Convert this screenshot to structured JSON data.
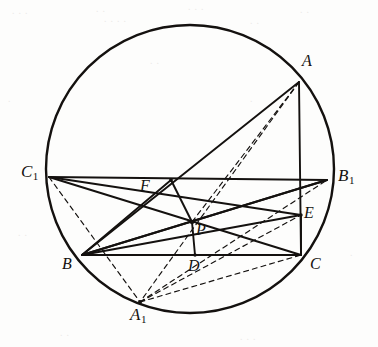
{
  "figure": {
    "kind": "geometry-diagram",
    "canvas": {
      "width": 378,
      "height": 347
    },
    "colors": {
      "ink": "#14110f",
      "paper": "#fdfdfc",
      "artifact": "#cfcdc9"
    },
    "circle": {
      "cx": 190,
      "cy": 169,
      "r": 144,
      "stroke_width": 2.4
    },
    "points": [
      {
        "id": "A",
        "label": "A",
        "sub": "",
        "x": 299,
        "y": 82,
        "label_x": 302,
        "label_y": 53
      },
      {
        "id": "B",
        "label": "B",
        "sub": "",
        "x": 82,
        "y": 255,
        "label_x": 62,
        "label_y": 256
      },
      {
        "id": "C",
        "label": "C",
        "sub": "",
        "x": 301,
        "y": 255,
        "label_x": 310,
        "label_y": 256
      },
      {
        "id": "A1",
        "label": "A",
        "sub": "1",
        "x": 140,
        "y": 302,
        "label_x": 130,
        "label_y": 306
      },
      {
        "id": "B1",
        "label": "B",
        "sub": "1",
        "x": 327,
        "y": 180,
        "label_x": 338,
        "label_y": 167
      },
      {
        "id": "C1",
        "label": "C",
        "sub": "1",
        "x": 49,
        "y": 177,
        "label_x": 21,
        "label_y": 163
      },
      {
        "id": "D",
        "label": "D",
        "sub": "",
        "x": 195,
        "y": 255,
        "label_x": 188,
        "label_y": 258
      },
      {
        "id": "E",
        "label": "E",
        "sub": "",
        "x": 301,
        "y": 215,
        "label_x": 304,
        "label_y": 205
      },
      {
        "id": "F",
        "label": "F",
        "sub": "",
        "x": 171,
        "y": 180,
        "label_x": 140,
        "label_y": 178
      },
      {
        "id": "P",
        "label": "P",
        "sub": "",
        "x": 192,
        "y": 222,
        "label_x": 196,
        "label_y": 222
      }
    ],
    "solid_segments": [
      {
        "name": "side-AB",
        "from": "A",
        "to": "B"
      },
      {
        "name": "side-AC",
        "from": "A",
        "to": "C"
      },
      {
        "name": "side-BC",
        "from": "B",
        "to": "C"
      },
      {
        "name": "chord-C1B1",
        "from": "C1",
        "to": "B1"
      },
      {
        "name": "cevian-C1-P-C",
        "from": "C1",
        "to": "C"
      },
      {
        "name": "cevian-B1-P-B",
        "from": "B1",
        "to": "B"
      },
      {
        "name": "segment-C1-E",
        "from": "C1",
        "to": "E"
      },
      {
        "name": "segment-B-E",
        "from": "B",
        "to": "E"
      },
      {
        "name": "segment-B1-B",
        "from": "B1",
        "to": "B"
      },
      {
        "name": "segment-F-P",
        "from": "F",
        "to": "P"
      },
      {
        "name": "segment-F-B",
        "from": "F",
        "to": "B"
      },
      {
        "name": "segment-P-D",
        "from": "P",
        "to": "D"
      },
      {
        "name": "segment-E-C",
        "from": "E",
        "to": "C"
      }
    ],
    "dashed_segments": [
      {
        "name": "dashed-A-A1",
        "from": "A",
        "to": "A1"
      },
      {
        "name": "dashed-A-P",
        "from": "A",
        "to": "P"
      },
      {
        "name": "dashed-C1-A1",
        "from": "C1",
        "to": "A1"
      },
      {
        "name": "dashed-A1-B1",
        "from": "A1",
        "to": "B1"
      },
      {
        "name": "dashed-A1-E",
        "from": "A1",
        "to": "E"
      },
      {
        "name": "dashed-A1-C",
        "from": "A1",
        "to": "C"
      },
      {
        "name": "dashed-B-D",
        "from": "B",
        "to": "D"
      }
    ],
    "artifacts": [
      {
        "text": "∙ ∙ ∙",
        "x": 12,
        "y": 8
      },
      {
        "text": "∙ ∙",
        "x": 96,
        "y": 6
      },
      {
        "text": "∙ ∙ ∙",
        "x": 188,
        "y": 4
      },
      {
        "text": "∙ ∙",
        "x": 300,
        "y": 7
      },
      {
        "text": "∙ ∙ ∙ ∙",
        "x": 104,
        "y": 16
      },
      {
        "text": "∙ ∙",
        "x": 250,
        "y": 18
      },
      {
        "text": "∙",
        "x": 8,
        "y": 96
      },
      {
        "text": "∙ ∙",
        "x": 150,
        "y": 58
      },
      {
        "text": "∙",
        "x": 250,
        "y": 96
      },
      {
        "text": "∙ ∙",
        "x": 18,
        "y": 230
      },
      {
        "text": "∙",
        "x": 350,
        "y": 250
      },
      {
        "text": "∙ ∙",
        "x": 60,
        "y": 330
      },
      {
        "text": "∙ ∙ ∙",
        "x": 240,
        "y": 334
      }
    ]
  }
}
